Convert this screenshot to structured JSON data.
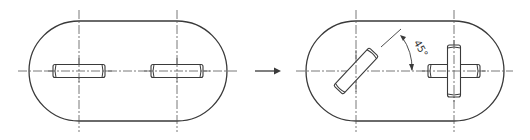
{
  "diagram": {
    "before": {
      "name": "original-layout",
      "pins": [
        {
          "id": "left-pin",
          "orientation": "horizontal"
        },
        {
          "id": "right-pin",
          "orientation": "horizontal"
        }
      ]
    },
    "after": {
      "name": "modified-layout",
      "pins": [
        {
          "id": "rotated-pin",
          "orientation": "rotated",
          "angle_deg": 45
        },
        {
          "id": "cross-pin",
          "orientation": "crossed horizontal + vertical"
        }
      ],
      "angle_label": "45°"
    },
    "arrow": {
      "icon": "right-arrow-icon",
      "meaning": "transforms to"
    },
    "colors": {
      "line": "#3a3a3a",
      "background": "#ffffff"
    }
  }
}
